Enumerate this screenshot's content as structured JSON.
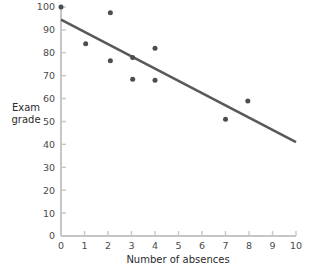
{
  "chart_data": {
    "type": "scatter",
    "title": "",
    "xlabel": "Number of absences",
    "ylabel": "Exam grade",
    "ylabel_lines": [
      "Exam",
      "grade"
    ],
    "xlim": [
      0,
      10
    ],
    "ylim": [
      0,
      100
    ],
    "grid": false,
    "legend": null,
    "x_ticks": [
      0,
      1,
      2,
      3,
      4,
      5,
      6,
      7,
      8,
      9,
      10
    ],
    "x_tick_labels": [
      "0",
      "1",
      "2",
      "3",
      "4",
      "5",
      "6",
      "7",
      "8",
      "9",
      "10"
    ],
    "y_ticks": [
      0,
      10,
      20,
      30,
      40,
      50,
      60,
      70,
      80,
      90,
      100
    ],
    "y_tick_labels": [
      "0",
      "10",
      "20",
      "30",
      "40",
      "50",
      "60",
      "70",
      "80",
      "90",
      "100"
    ],
    "points": [
      {
        "x": 0.0,
        "y": 100.0
      },
      {
        "x": 1.05,
        "y": 84.0
      },
      {
        "x": 2.1,
        "y": 97.5
      },
      {
        "x": 2.1,
        "y": 76.5
      },
      {
        "x": 3.05,
        "y": 78.0
      },
      {
        "x": 3.05,
        "y": 68.5
      },
      {
        "x": 4.0,
        "y": 82.0
      },
      {
        "x": 4.0,
        "y": 68.0
      },
      {
        "x": 7.0,
        "y": 51.0
      },
      {
        "x": 7.95,
        "y": 59.0
      }
    ],
    "point_color": "#4d4d4d",
    "point_size_px": 5,
    "trend_line": {
      "type": "line",
      "x": [
        0,
        10
      ],
      "y": [
        94.5,
        41.0
      ],
      "color": "#595959",
      "width_px": 2.6
    },
    "axis_color": "#c6c6c6",
    "tick_color": "#c6c6c6",
    "text_color": "#2b2b2b"
  }
}
